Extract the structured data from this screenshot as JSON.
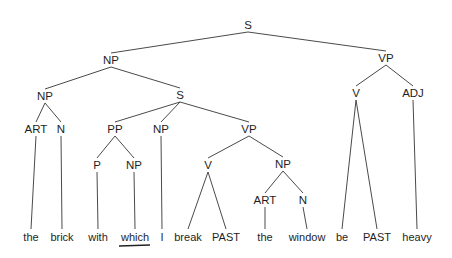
{
  "diagram": {
    "type": "syntax-tree",
    "nodes": [
      {
        "id": "s_root",
        "label": "S",
        "x": 248,
        "y": 25,
        "parent": null
      },
      {
        "id": "np_top",
        "label": "NP",
        "x": 111,
        "y": 60,
        "parent": "s_root"
      },
      {
        "id": "vp_top",
        "label": "VP",
        "x": 386,
        "y": 58,
        "parent": "s_root"
      },
      {
        "id": "np_left",
        "label": "NP",
        "x": 45,
        "y": 96,
        "parent": "np_top"
      },
      {
        "id": "s_rel",
        "label": "S",
        "x": 180,
        "y": 95,
        "parent": "np_top"
      },
      {
        "id": "v_main",
        "label": "V",
        "x": 356,
        "y": 93,
        "parent": "vp_top"
      },
      {
        "id": "adj",
        "label": "ADJ",
        "x": 413,
        "y": 93,
        "parent": "vp_top"
      },
      {
        "id": "art1",
        "label": "ART",
        "x": 36,
        "y": 129,
        "parent": "np_left"
      },
      {
        "id": "n1",
        "label": "N",
        "x": 61,
        "y": 129,
        "parent": "np_left"
      },
      {
        "id": "pp",
        "label": "PP",
        "x": 115,
        "y": 129,
        "parent": "s_rel"
      },
      {
        "id": "np_i",
        "label": "NP",
        "x": 161,
        "y": 129,
        "parent": "s_rel"
      },
      {
        "id": "vp_rel",
        "label": "VP",
        "x": 249,
        "y": 129,
        "parent": "s_rel"
      },
      {
        "id": "p",
        "label": "P",
        "x": 97,
        "y": 165,
        "parent": "pp"
      },
      {
        "id": "np_which",
        "label": "NP",
        "x": 134,
        "y": 165,
        "parent": "pp"
      },
      {
        "id": "v_break",
        "label": "V",
        "x": 208,
        "y": 165,
        "parent": "vp_rel"
      },
      {
        "id": "np_window",
        "label": "NP",
        "x": 283,
        "y": 164,
        "parent": "vp_rel"
      },
      {
        "id": "art2",
        "label": "ART",
        "x": 265,
        "y": 200,
        "parent": "np_window"
      },
      {
        "id": "n2",
        "label": "N",
        "x": 303,
        "y": 200,
        "parent": "np_window"
      }
    ],
    "words": [
      {
        "text": "the",
        "x": 31,
        "parent": "art1"
      },
      {
        "text": "brick",
        "x": 62,
        "parent": "n1"
      },
      {
        "text": "with",
        "x": 98,
        "parent": "p"
      },
      {
        "text": "which",
        "x": 135,
        "parent": "np_which",
        "underlined": true
      },
      {
        "text": "I",
        "x": 162,
        "parent": "np_i"
      },
      {
        "text": "break",
        "x": 188,
        "parent": "v_break"
      },
      {
        "text": "PAST",
        "x": 226,
        "parent": "v_break"
      },
      {
        "text": "the",
        "x": 265,
        "parent": "art2"
      },
      {
        "text": "window",
        "x": 307,
        "parent": "n2"
      },
      {
        "text": "be",
        "x": 342,
        "parent": "v_main"
      },
      {
        "text": "PAST",
        "x": 377,
        "parent": "v_main"
      },
      {
        "text": "heavy",
        "x": 417,
        "parent": "adj"
      }
    ],
    "word_baseline_y": 241,
    "word_top_y": 229
  }
}
